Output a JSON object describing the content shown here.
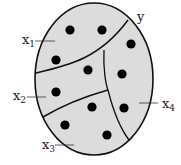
{
  "diagram": {
    "type": "partition-of-set",
    "set_label": "y",
    "region_fill": "#dcdcdc",
    "stroke_color": "#111111",
    "dot_color": "#000000",
    "labels": [
      {
        "id": "x1",
        "base": "x",
        "sub": "1"
      },
      {
        "id": "x2",
        "base": "x",
        "sub": "2"
      },
      {
        "id": "x3",
        "base": "x",
        "sub": "3"
      },
      {
        "id": "x4",
        "base": "x",
        "sub": "4"
      }
    ],
    "dots": [
      [
        70,
        30
      ],
      [
        102,
        30
      ],
      [
        131,
        44
      ],
      [
        56,
        60
      ],
      [
        88,
        70
      ],
      [
        122,
        74
      ],
      [
        56,
        92
      ],
      [
        92,
        107
      ],
      [
        124,
        108
      ],
      [
        65,
        125
      ],
      [
        107,
        135
      ]
    ]
  }
}
